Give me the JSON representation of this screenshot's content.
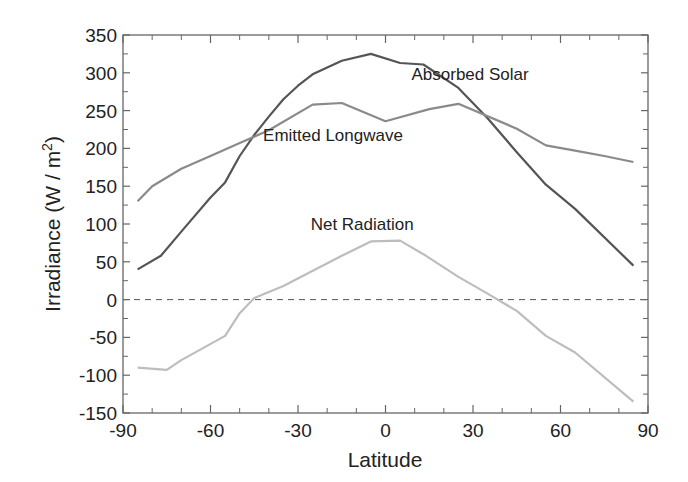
{
  "chart_data": {
    "type": "line",
    "title": "",
    "xlabel": "Latitude",
    "ylabel": "Irradiance  (W / m²)",
    "ylabel_main": "Irradiance  (W / m",
    "ylabel_sup": "2",
    "ylabel_tail": ")",
    "xlim": [
      -90,
      90
    ],
    "ylim": [
      -150,
      350
    ],
    "grid": false,
    "legend": "inline labels",
    "x_ticks": [
      -90,
      -60,
      -30,
      0,
      30,
      60,
      90
    ],
    "x_tick_labels": [
      "-90",
      "-60",
      "-30",
      "0",
      "30",
      "60",
      "90"
    ],
    "y_ticks": [
      350,
      300,
      250,
      200,
      150,
      100,
      50,
      0,
      -50,
      -100,
      -150
    ],
    "y_tick_labels": [
      "350",
      "300",
      "250",
      "200",
      "150",
      "100",
      "50",
      "0",
      "-50",
      "-100",
      "-150"
    ],
    "reference_line": {
      "y": 0,
      "style": "dashed"
    },
    "series": [
      {
        "name": "Absorbed Solar",
        "color": "#555555",
        "label_pos": [
          29,
          290
        ],
        "x": [
          -85,
          -77,
          -70,
          -60,
          -55,
          -50,
          -45,
          -40,
          -35,
          -30,
          -25,
          -15,
          -5,
          5,
          13,
          25,
          35,
          45,
          55,
          65,
          85
        ],
        "y": [
          40,
          58,
          90,
          135,
          155,
          190,
          218,
          242,
          265,
          283,
          298,
          316,
          325,
          313,
          311,
          280,
          240,
          195,
          152,
          120,
          45
        ]
      },
      {
        "name": "Emitted Longwave",
        "color": "#8a8a8a",
        "label_pos": [
          -18,
          210
        ],
        "x": [
          -85,
          -80,
          -70,
          -60,
          -50,
          -40,
          -25,
          -15,
          0,
          15,
          25,
          45,
          55,
          65,
          75,
          85
        ],
        "y": [
          130,
          150,
          173,
          190,
          207,
          224,
          258,
          260,
          236,
          252,
          259,
          226,
          204,
          197,
          190,
          182
        ]
      },
      {
        "name": "Net Radiation",
        "color": "#bdbdbd",
        "label_pos": [
          -8,
          92
        ],
        "x": [
          -85,
          -75,
          -70,
          -55,
          -50,
          -45,
          -35,
          -15,
          -5,
          5,
          13,
          25,
          35,
          45,
          55,
          65,
          85
        ],
        "y": [
          -90,
          -93,
          -80,
          -48,
          -18,
          2,
          18,
          58,
          77,
          78,
          60,
          30,
          8,
          -15,
          -48,
          -70,
          -135
        ]
      }
    ]
  }
}
